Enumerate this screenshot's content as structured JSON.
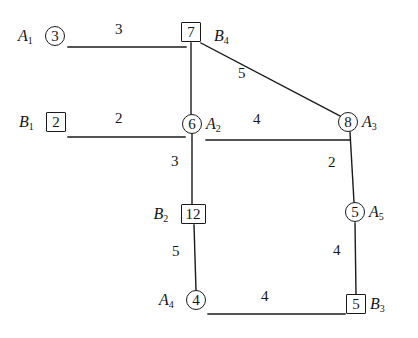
{
  "diagram": {
    "line_color": "#1a1a1a",
    "text_color": "#151515",
    "background": "#ffffff",
    "nodes": [
      {
        "id": "n7",
        "value": "7",
        "shape": "square",
        "label": "",
        "sub": "",
        "cx": 191,
        "cy": 32
      },
      {
        "id": "n3",
        "value": "3",
        "shape": "circle",
        "label": "A",
        "sub": "1",
        "cx": 55,
        "cy": 36
      },
      {
        "id": "n2",
        "value": "2",
        "shape": "square",
        "label": "B",
        "sub": "1",
        "cx": 56,
        "cy": 122
      },
      {
        "id": "n6",
        "value": "6",
        "shape": "circle",
        "label": "A",
        "sub": "2",
        "cx": 192,
        "cy": 124
      },
      {
        "id": "n8",
        "value": "8",
        "shape": "circle",
        "label": "A",
        "sub": "3",
        "cx": 348,
        "cy": 122
      },
      {
        "id": "n12",
        "value": "12",
        "shape": "square",
        "label": "B",
        "sub": "2",
        "cx": 193,
        "cy": 214
      },
      {
        "id": "n5c",
        "value": "5",
        "shape": "circle",
        "label": "A",
        "sub": "5",
        "cx": 355,
        "cy": 212
      },
      {
        "id": "n4",
        "value": "4",
        "shape": "circle",
        "label": "A",
        "sub": "4",
        "cx": 196,
        "cy": 300
      },
      {
        "id": "n5s",
        "value": "5",
        "shape": "square",
        "label": "B",
        "sub": "3",
        "cx": 356,
        "cy": 304
      }
    ],
    "extra_labels": [
      {
        "id": "b4",
        "label": "B",
        "sub": "4",
        "x": 214,
        "y": 36
      }
    ],
    "edges": [
      {
        "id": "e-a1-7",
        "from": "A1 stub",
        "to": "n7",
        "weight": "3",
        "x1": 68,
        "y1": 47,
        "x2": 186,
        "y2": 47,
        "wx": 120,
        "wy": 30
      },
      {
        "id": "e-7-8",
        "from": "n7",
        "to": "n8",
        "weight": "5",
        "x1": 201,
        "y1": 43,
        "x2": 344,
        "y2": 118,
        "wx": 243,
        "wy": 74
      },
      {
        "id": "e-b1-6",
        "from": "B1 stub",
        "to": "n6",
        "weight": "2",
        "x1": 68,
        "y1": 137,
        "x2": 185,
        "y2": 137,
        "wx": 120,
        "wy": 119
      },
      {
        "id": "e-7-6",
        "from": "n7",
        "to": "n6",
        "weight": "",
        "x1": 191,
        "y1": 43,
        "x2": 191,
        "y2": 114,
        "wx": 0,
        "wy": 0
      },
      {
        "id": "e-6-8",
        "from": "n6",
        "to": "n8",
        "weight": "4",
        "x1": 206,
        "y1": 140,
        "x2": 350,
        "y2": 140,
        "wx": 258,
        "wy": 120
      },
      {
        "id": "e-6-12",
        "from": "n6",
        "to": "n12",
        "weight": "3",
        "x1": 192,
        "y1": 134,
        "x2": 192,
        "y2": 204,
        "wx": 176,
        "wy": 162
      },
      {
        "id": "e-8-5",
        "from": "n8",
        "to": "n5c",
        "weight": "2",
        "x1": 350,
        "y1": 132,
        "x2": 354,
        "y2": 202,
        "wx": 333,
        "wy": 163
      },
      {
        "id": "e-12-4",
        "from": "n12",
        "to": "n4",
        "weight": "5",
        "x1": 194,
        "y1": 225,
        "x2": 196,
        "y2": 290,
        "wx": 177,
        "wy": 252
      },
      {
        "id": "e-5-5",
        "from": "n5c",
        "to": "n5s",
        "weight": "4",
        "x1": 355,
        "y1": 223,
        "x2": 356,
        "y2": 294,
        "wx": 338,
        "wy": 251
      },
      {
        "id": "e-4-5s",
        "from": "n4",
        "to": "n5s",
        "weight": "4",
        "x1": 208,
        "y1": 314,
        "x2": 345,
        "y2": 314,
        "wx": 266,
        "wy": 297
      }
    ]
  }
}
